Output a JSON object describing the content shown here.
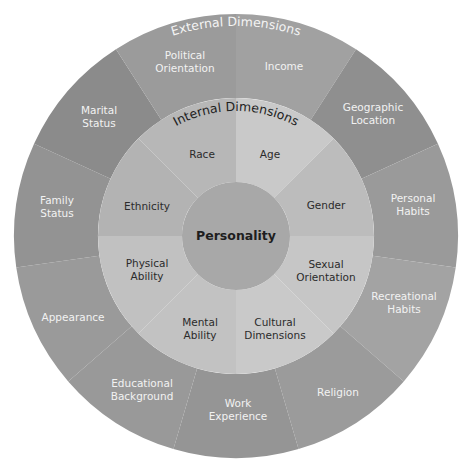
{
  "diagram": {
    "center": {
      "x": 236,
      "y": 236
    },
    "outer_ring": {
      "title": "External Dimensions",
      "radius": 222,
      "inner_radius": 138,
      "start_angle_deg": 0,
      "segments": [
        {
          "label": [
            "Income"
          ],
          "color": "#a1a1a1",
          "label_pos": [
            284,
            66
          ]
        },
        {
          "label": [
            "Geographic",
            "Location"
          ],
          "color": "#8f8f8f",
          "label_pos": [
            373,
            113
          ]
        },
        {
          "label": [
            "Personal",
            "Habits"
          ],
          "color": "#9a9a9a",
          "label_pos": [
            413,
            204
          ]
        },
        {
          "label": [
            "Recreational",
            "Habits"
          ],
          "color": "#a3a3a3",
          "label_pos": [
            404,
            302
          ]
        },
        {
          "label": [
            "Religion"
          ],
          "color": "#9b9b9b",
          "label_pos": [
            338,
            392
          ]
        },
        {
          "label": [
            "Work",
            "Experience"
          ],
          "color": "#959595",
          "label_pos": [
            238,
            409
          ]
        },
        {
          "label": [
            "Educational",
            "Background"
          ],
          "color": "#999999",
          "label_pos": [
            142,
            389
          ]
        },
        {
          "label": [
            "Appearance"
          ],
          "color": "#9a9a9a",
          "label_pos": [
            73,
            317
          ]
        },
        {
          "label": [
            "Family",
            "Status"
          ],
          "color": "#939393",
          "label_pos": [
            57,
            206
          ]
        },
        {
          "label": [
            "Marital",
            "Status"
          ],
          "color": "#8b8b8b",
          "label_pos": [
            99,
            116
          ]
        },
        {
          "label": [
            "Political",
            "Orientation"
          ],
          "color": "#9b9b9b",
          "label_pos": [
            185,
            61
          ]
        }
      ]
    },
    "inner_ring": {
      "title": "Internal Dimensions",
      "radius": 138,
      "inner_radius": 54,
      "start_angle_deg": 0,
      "segments": [
        {
          "label": [
            "Age"
          ],
          "color": "#c9c9c9",
          "label_pos": [
            270,
            154
          ]
        },
        {
          "label": [
            "Gender"
          ],
          "color": "#bcbcbc",
          "label_pos": [
            326,
            205
          ]
        },
        {
          "label": [
            "Sexual",
            "Orientation"
          ],
          "color": "#c6c6c6",
          "label_pos": [
            326,
            270
          ]
        },
        {
          "label": [
            "Cultural",
            "Dimensions"
          ],
          "color": "#c9c9c9",
          "label_pos": [
            275,
            328
          ]
        },
        {
          "label": [
            "Mental",
            "Ability"
          ],
          "color": "#c2c2c2",
          "label_pos": [
            200,
            328
          ]
        },
        {
          "label": [
            "Physical",
            "Ability"
          ],
          "color": "#c1c1c1",
          "label_pos": [
            147,
            269
          ]
        },
        {
          "label": [
            "Ethnicity"
          ],
          "color": "#b3b3b3",
          "label_pos": [
            147,
            206
          ]
        },
        {
          "label": [
            "Race"
          ],
          "color": "#b7b7b7",
          "label_pos": [
            202,
            154
          ]
        }
      ]
    },
    "core": {
      "label": "Personality",
      "radius": 54,
      "color": "#a8a8a8"
    }
  }
}
